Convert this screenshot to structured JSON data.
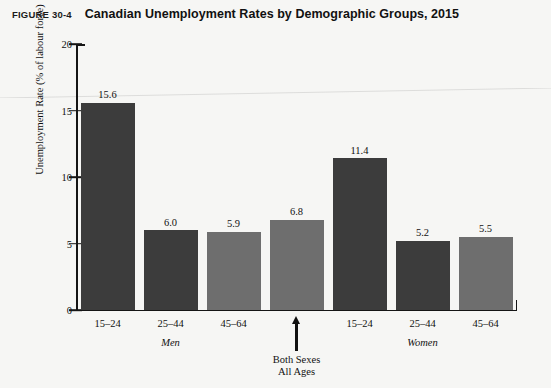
{
  "figure": {
    "label": "FIGURE 30-4",
    "title": "Canadian Unemployment Rates by Demographic Groups, 2015"
  },
  "annotation": {
    "line1": "Both Sexes",
    "line2": "All Ages",
    "arrow_icon": "up-arrow-icon"
  },
  "chart_data": {
    "type": "bar",
    "title": "Canadian Unemployment Rates by Demographic Groups, 2015",
    "xlabel": "",
    "ylabel": "Unemployment Rate (% of labour force)",
    "ylim": [
      0,
      20
    ],
    "yticks": [
      0,
      5,
      10,
      15,
      20
    ],
    "ytick_labels": [
      "0",
      "5",
      "10",
      "15",
      "20"
    ],
    "grid": false,
    "legend": false,
    "categories": [
      "15–24",
      "25–44",
      "45–64",
      "",
      "15–24",
      "25–44",
      "45–64"
    ],
    "values": [
      15.6,
      6.0,
      5.9,
      6.8,
      11.4,
      5.2,
      5.5
    ],
    "value_labels": [
      "15.6",
      "6.0",
      "5.9",
      "6.8",
      "11.4",
      "5.2",
      "5.5"
    ],
    "bar_colors": [
      "#3c3c3c",
      "#3c3c3c",
      "#6e6e6e",
      "#6e6e6e",
      "#3c3c3c",
      "#3c3c3c",
      "#6e6e6e"
    ],
    "groups": [
      {
        "name": "Men",
        "bars": [
          0,
          1,
          2
        ]
      },
      {
        "name": "Both Sexes All Ages",
        "bars": [
          3
        ]
      },
      {
        "name": "Women",
        "bars": [
          4,
          5,
          6
        ]
      }
    ],
    "group_labels": [
      "Men",
      "Women"
    ],
    "annotations": [
      {
        "text": "Both Sexes All Ages",
        "points_to_bar": 3
      }
    ]
  }
}
